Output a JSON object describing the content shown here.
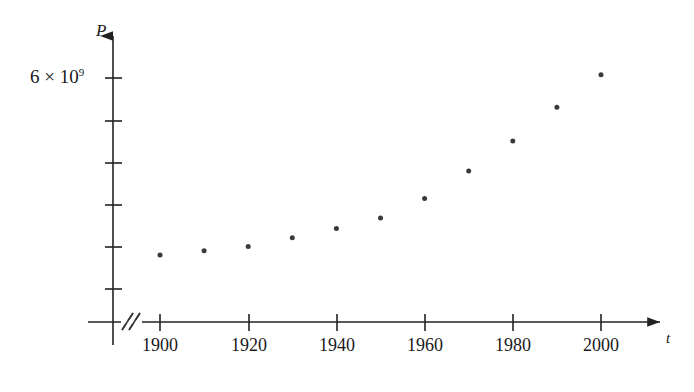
{
  "figure": {
    "background_color": "#ffffff",
    "axis_color": "#222222",
    "point_color": "#3a3a3a"
  },
  "axes": {
    "y_axis_label": "P",
    "x_axis_label": "t",
    "y_tick_label": "6 × 10",
    "y_tick_exponent": "9",
    "x_tick_labels": [
      "1900",
      "1920",
      "1940",
      "1960",
      "1980",
      "2000"
    ],
    "axis_break_symbol": "//"
  },
  "chart_data": {
    "type": "scatter",
    "title": "",
    "xlabel": "t",
    "ylabel": "P",
    "x": [
      1900,
      1910,
      1920,
      1930,
      1940,
      1950,
      1960,
      1970,
      1980,
      1990,
      2000
    ],
    "y": [
      1650000000,
      1750000000,
      1860000000,
      2070000000,
      2300000000,
      2560000000,
      3040000000,
      3710000000,
      4450000000,
      5280000000,
      6080000000
    ],
    "y_display": [
      "1.65×10⁹",
      "1.75×10⁹",
      "1.86×10⁹",
      "2.07×10⁹",
      "2.30×10⁹",
      "2.56×10⁹",
      "3.04×10⁹",
      "3.71×10⁹",
      "4.45×10⁹",
      "5.28×10⁹",
      "6.08×10⁹"
    ],
    "categories": [
      "1900",
      "1910",
      "1920",
      "1930",
      "1940",
      "1950",
      "1960",
      "1970",
      "1980",
      "1990",
      "2000"
    ],
    "xlim": [
      1890,
      2010
    ],
    "ylim": [
      0,
      7000000000
    ],
    "x_ticks": [
      1900,
      1920,
      1940,
      1960,
      1980,
      2000
    ],
    "y_ticks_labeled": [
      {
        "value": 6000000000,
        "label": "6 × 10⁹"
      }
    ],
    "y_tick_count": 7,
    "grid": false,
    "legend": false,
    "axis_break_on_x": true,
    "marker": "filled-circle",
    "marker_size": 5
  }
}
